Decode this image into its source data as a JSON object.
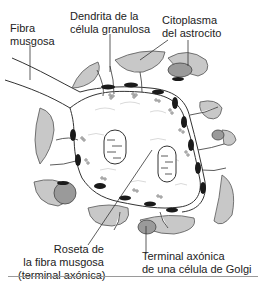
{
  "diagram": {
    "colors": {
      "astrocyte_fill": "#c8c8c8",
      "synapse_dark": "#1a1a1a",
      "outline": "#333333",
      "background": "#ffffff"
    },
    "labels": {
      "mossy_fiber": [
        "Fibra",
        "musgosa"
      ],
      "granule_dendrite": [
        "Dendrita de la",
        "célula granulosa"
      ],
      "astrocyte_cytoplasm": [
        "Citoplasma",
        "del astrocito"
      ],
      "rosette": [
        "Roseta de",
        "la fibra musgosa",
        "(terminal axónica)"
      ],
      "golgi_terminal": [
        "Terminal axónica",
        "de una célula de Golgi"
      ]
    }
  }
}
